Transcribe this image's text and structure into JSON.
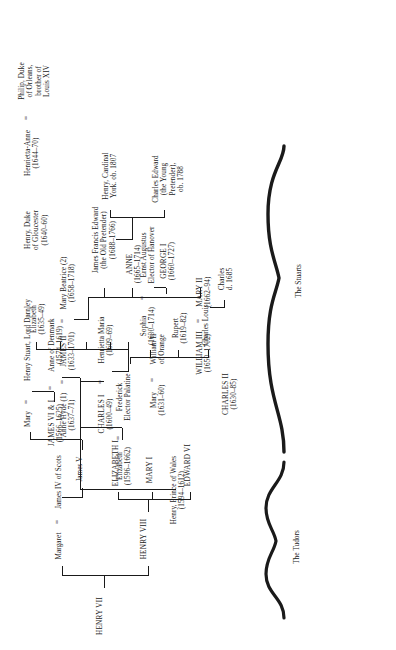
{
  "document": {
    "type": "genealogical-family-tree",
    "orientation": "rotated-90-counterclockwise",
    "page_width": 396,
    "page_height": 650,
    "ink_color": "#1a1a1a",
    "background_color": "#ffffff"
  },
  "groups": [
    {
      "id": "tudors",
      "label": "The Tudors"
    },
    {
      "id": "stuarts",
      "label": "The Stuarts"
    }
  ],
  "people": {
    "henry_vii": {
      "name": "HENRY VII",
      "dates": ""
    },
    "henry_viii": {
      "name": "HENRY VIII",
      "dates": ""
    },
    "margaret": {
      "name": "Margaret",
      "dates": ""
    },
    "james_iv": {
      "name": "James IV of Scots",
      "dates": ""
    },
    "edward_vi": {
      "name": "EDWARD VI",
      "dates": ""
    },
    "mary_i": {
      "name": "MARY I",
      "dates": ""
    },
    "elizabeth_i": {
      "name": "ELIZABETH I",
      "dates": ""
    },
    "james_v": {
      "name": "James V",
      "dates": ""
    },
    "mary_qos": {
      "name": "Mary",
      "dates": ""
    },
    "henry_darnley": {
      "name": "Henry Stuart, Lord Darnley",
      "dates": ""
    },
    "james_vi_i": {
      "name": "JAMES VI & I",
      "dates": "(1566–1625)"
    },
    "anne_denmark": {
      "name": "Anne of Denmark",
      "dates": "(1574–1619)"
    },
    "henry_prince_wales": {
      "name": "Henry, Prince of Wales",
      "dates": "(1594–1612)"
    },
    "elizabeth_bohemia": {
      "name": "Elizabeth",
      "dates": "(1596–1662)"
    },
    "frederick": {
      "name": "Frederick",
      "dates": "Elector Palatine"
    },
    "charles_i": {
      "name": "CHARLES I",
      "dates": "(1600–49)"
    },
    "henrietta_maria": {
      "name": "Henrietta Maria",
      "dates": "(1609–69)"
    },
    "charles_louis": {
      "name": "Charles Louis",
      "dates": ""
    },
    "rupert": {
      "name": "Rupert",
      "dates": "(1619–82)"
    },
    "sophia": {
      "name": "Sophia",
      "dates": "(1630–1714)"
    },
    "ernst_augustus": {
      "name": "Ernst Augustus",
      "dates": "Elector of Hanover"
    },
    "charles_d1685": {
      "name": "Charles",
      "dates": "d. 1685"
    },
    "george_i": {
      "name": "GEORGE I",
      "dates": "(1660–1727)"
    },
    "charles_ii": {
      "name": "CHARLES II",
      "dates": "(1630–85)"
    },
    "mary_orange": {
      "name": "Mary",
      "dates": "(1631–60)"
    },
    "william_ii_orange": {
      "name": "William II",
      "dates": "of Orange"
    },
    "anne_hyde": {
      "name": "Anne Hyde (1)",
      "dates": "(1637–71)"
    },
    "james_ii": {
      "name": "JAMES II",
      "dates": "(1633–1701)"
    },
    "mary_beatrice": {
      "name": "Mary Beatrice (2)",
      "dates": "(1658–1718)"
    },
    "elizabeth_1635": {
      "name": "Elizabeth",
      "dates": "(1635–49)"
    },
    "henry_gloucester": {
      "name": "Henry, Duke",
      "dates": "of Gloucester\n(1640–60)"
    },
    "henrietta_anne": {
      "name": "Henrietta-Anne",
      "dates": "(1644–70)"
    },
    "philip_orleans": {
      "name": "Philip, Duke",
      "dates": "of Orleans,\nbrother of\nLouis XIV"
    },
    "william_iii": {
      "name": "WILLIAM III",
      "dates": "(1650–1702)"
    },
    "mary_ii": {
      "name": "MARY II",
      "dates": "(1662–94)"
    },
    "anne": {
      "name": "ANNE",
      "dates": "(1665–1714)"
    },
    "james_francis_edward": {
      "name": "James Francis Edward",
      "dates": "(the Old Pretender)\n(1688–1766)"
    },
    "charles_edward": {
      "name": "Charles Edward",
      "dates": "(the Young\nPretender),\nob. 1788"
    },
    "henry_cardinal_york": {
      "name": "Henry, Cardinal",
      "dates": "York. ob. 1807"
    }
  },
  "marriages": [
    {
      "left": "margaret",
      "right": "james_iv",
      "symbol": "="
    },
    {
      "left": "mary_qos",
      "right": "henry_darnley",
      "symbol": "="
    },
    {
      "left": "james_vi_i",
      "right": "anne_denmark",
      "symbol": "="
    },
    {
      "left": "elizabeth_bohemia",
      "right": "frederick",
      "symbol": "="
    },
    {
      "left": "charles_i",
      "right": "henrietta_maria",
      "symbol": "="
    },
    {
      "left": "anne_hyde",
      "right": "james_ii",
      "symbol": "="
    },
    {
      "left": "james_ii",
      "right": "mary_beatrice",
      "symbol": "="
    },
    {
      "left": "mary_orange",
      "right": "william_ii_orange",
      "symbol": "="
    },
    {
      "left": "sophia",
      "right": "ernst_augustus",
      "symbol": "="
    },
    {
      "left": "william_iii",
      "right": "mary_ii",
      "symbol": "="
    },
    {
      "left": "henrietta_anne",
      "right": "philip_orleans",
      "symbol": "="
    }
  ]
}
